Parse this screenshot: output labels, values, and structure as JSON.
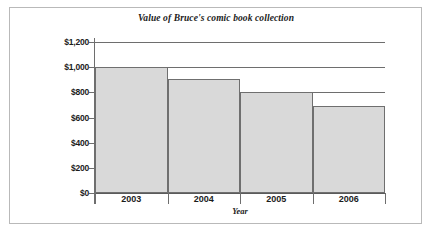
{
  "chart_data": {
    "type": "bar",
    "title": "Value of Bruce's comic book collection",
    "xlabel": "Year",
    "ylabel": "",
    "categories": [
      "2003",
      "2004",
      "2005",
      "2006"
    ],
    "values": [
      1000,
      910,
      800,
      690
    ],
    "ylim": [
      0,
      1200
    ],
    "ytick_values": [
      0,
      200,
      400,
      600,
      800,
      1000,
      1200
    ],
    "ytick_labels": [
      "$0",
      "$200",
      "$400",
      "$600",
      "$800",
      "$1,000",
      "$1,200"
    ],
    "grid": "horizontal",
    "legend": "none",
    "bar_fill_color": "#d9d9d9",
    "bar_border_color": "#6f6f6f",
    "axis_color": "#6e6e6e",
    "text_color": "#1b1b1b",
    "frame_color": "#b9b9b9",
    "bars_contiguous": true
  }
}
